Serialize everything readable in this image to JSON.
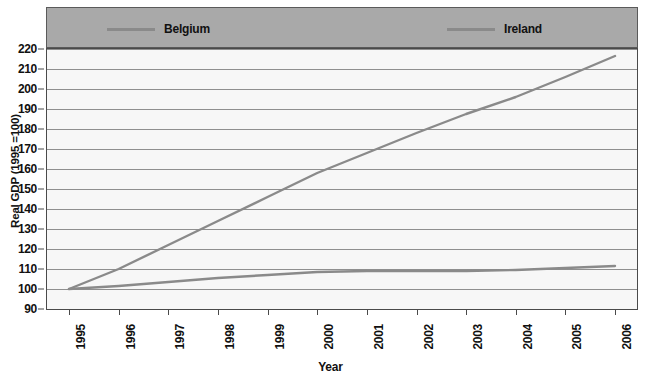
{
  "legend": {
    "entries": [
      {
        "label": "Belgium",
        "color": "#8a8a8a"
      },
      {
        "label": "Ireland",
        "color": "#8a8a8a"
      }
    ],
    "background": "#a9a9a9"
  },
  "axes": {
    "y_title": "Real GDP (1995 =100)",
    "x_title": "Year",
    "y_ticks": [
      "90",
      "100",
      "110",
      "120",
      "130",
      "140",
      "150",
      "160",
      "170",
      "180",
      "190",
      "200",
      "210",
      "220"
    ],
    "x_ticks": [
      "1995",
      "1996",
      "1997",
      "1998",
      "1999",
      "2000",
      "2001",
      "2002",
      "2003",
      "2004",
      "2005",
      "2006"
    ]
  },
  "chart_data": {
    "type": "line",
    "title": "",
    "xlabel": "Year",
    "ylabel": "Real GDP (1995 =100)",
    "categories": [
      1995,
      1996,
      1997,
      1998,
      1999,
      2000,
      2001,
      2002,
      2003,
      2004,
      2005,
      2006
    ],
    "x": [
      1995,
      1996,
      1997,
      1998,
      1999,
      2000,
      2001,
      2002,
      2003,
      2004,
      2005,
      2006
    ],
    "series": [
      {
        "name": "Belgium",
        "color": "#8a8a8a",
        "values": [
          100,
          101.5,
          103.5,
          105.5,
          107,
          108.5,
          109,
          109,
          109,
          109.5,
          110.5,
          111.5
        ]
      },
      {
        "name": "Ireland",
        "color": "#8a8a8a",
        "values": [
          100,
          110,
          122,
          134,
          146,
          158,
          168,
          178,
          187.5,
          196,
          206,
          216.5
        ]
      }
    ],
    "ylim": [
      90,
      220
    ],
    "ytick_step": 10,
    "xlim": [
      1995,
      2006
    ],
    "grid": "horizontal",
    "legend_position": "top"
  }
}
